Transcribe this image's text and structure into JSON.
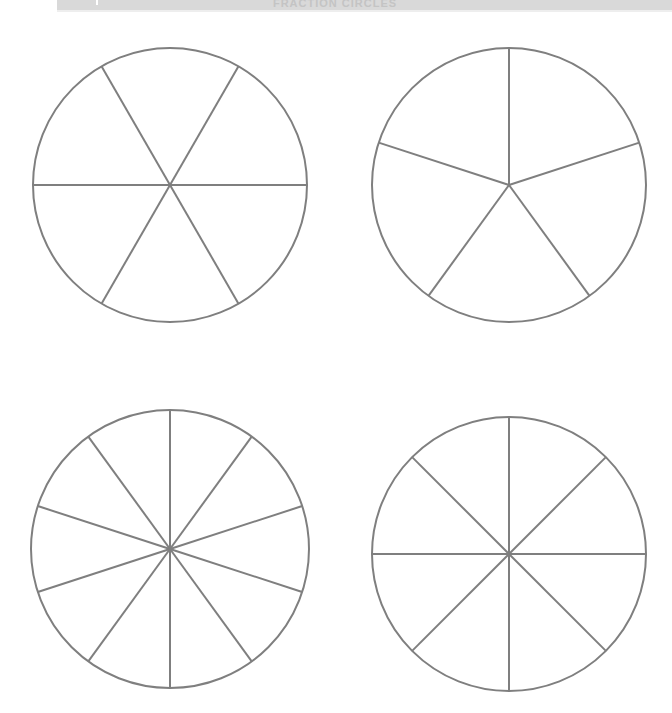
{
  "page": {
    "background_color": "#ffffff",
    "width": 672,
    "height": 713
  },
  "header": {
    "title": "FRACTION CIRCLES",
    "band_color": "#d9d9d9",
    "text_color": "#c4c4c4"
  },
  "style": {
    "line_color": "#7f7f7f",
    "line_width": 2
  },
  "chart_data": {
    "type": "pie",
    "title": "FRACTION CIRCLES",
    "xlabel": "",
    "ylabel": "",
    "grid": false,
    "legend": "none",
    "charts": [
      {
        "name": "sixths",
        "label": "1/6",
        "slices": 6,
        "slice_value": 1,
        "values": [
          1,
          1,
          1,
          1,
          1,
          1
        ],
        "start_angle_deg": 30,
        "center": {
          "x": 170,
          "y": 185
        },
        "radius": 137
      },
      {
        "name": "fifths",
        "label": "1/5",
        "slices": 5,
        "slice_value": 1,
        "values": [
          1,
          1,
          1,
          1,
          1
        ],
        "start_angle_deg": 0,
        "center": {
          "x": 509,
          "y": 185
        },
        "radius": 137
      },
      {
        "name": "tenths",
        "label": "1/10",
        "slices": 10,
        "slice_value": 1,
        "values": [
          1,
          1,
          1,
          1,
          1,
          1,
          1,
          1,
          1,
          1
        ],
        "start_angle_deg": 0,
        "center": {
          "x": 170,
          "y": 549
        },
        "radius": 139
      },
      {
        "name": "eighths",
        "label": "1/8",
        "slices": 8,
        "slice_value": 1,
        "values": [
          1,
          1,
          1,
          1,
          1,
          1,
          1,
          1
        ],
        "start_angle_deg": 0,
        "center": {
          "x": 509,
          "y": 554
        },
        "radius": 137
      }
    ]
  }
}
